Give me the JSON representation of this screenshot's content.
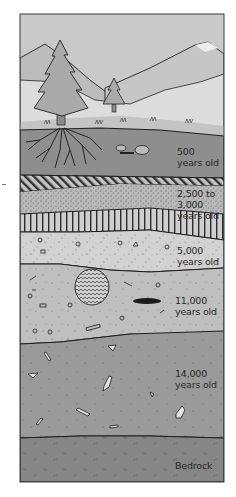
{
  "figure": {
    "scene": [
      "mountains",
      "large-pine-tree",
      "small-pine-tree",
      "grass",
      "tree-roots",
      "rocks"
    ],
    "layers": [
      {
        "id": "layer-500",
        "label_line1": "500",
        "label_line2": "years old",
        "pattern": "dark-soil-with-roots",
        "color": "#8e8e8e"
      },
      {
        "id": "layer-2500-3000",
        "label_line1": "2,500 to",
        "label_line2": "3,000",
        "label_line3": "years old",
        "pattern": "diagonal-hatch-stipple-vertical-bands",
        "color": "#b4b4b4"
      },
      {
        "id": "layer-5000",
        "label_line1": "5,000",
        "label_line2": "years old",
        "pattern": "light-speckled-pebbles",
        "color": "#cfcfcf"
      },
      {
        "id": "layer-11000",
        "label_line1": "11,000",
        "label_line2": "years old",
        "pattern": "gravel-with-pit-and-dark-lens",
        "color": "#bdbdbd"
      },
      {
        "id": "layer-14000",
        "label_line1": "14,000",
        "label_line2": "years old",
        "pattern": "dark-with-bone-fragments",
        "color": "#9a9a9a"
      },
      {
        "id": "bedrock",
        "label_line1": "Bedrock",
        "pattern": "dark-bedrock",
        "color": "#858585"
      }
    ],
    "colors": {
      "sky": "#c9c9c9",
      "mountain_far": "#bdbdbd",
      "mountain_snow": "#e8e8e8",
      "ground_line": "#1e1e1e",
      "tree": "#a8a8a8",
      "border": "#3a3a3a"
    }
  }
}
